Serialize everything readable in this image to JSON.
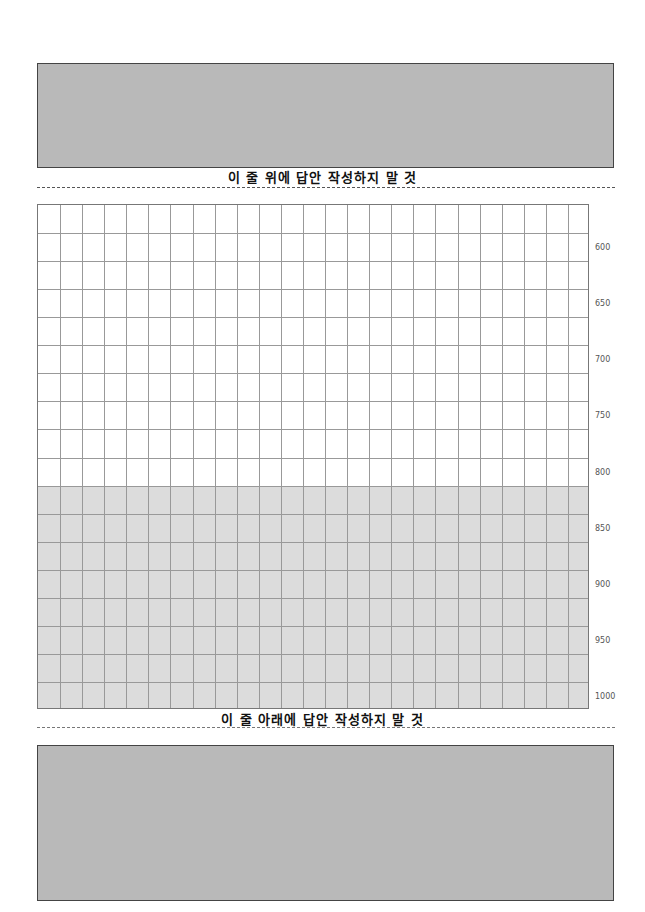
{
  "top_answer_box": {
    "label": ""
  },
  "top_notice": "이 줄 위에 답안 작성하지 말 것",
  "answer_grid": {
    "columns": 25,
    "rows": 18,
    "shaded_from_row": 10,
    "char_count_labels": [
      "600",
      "650",
      "700",
      "750",
      "800",
      "850",
      "900",
      "950",
      "1000"
    ]
  },
  "bottom_notice": "이 줄 아래에 답안 작성하지 말 것",
  "bottom_answer_box": {
    "label": ""
  },
  "colors": {
    "gray_box": "#b9b9b9",
    "shade": "#dcdcdc",
    "grid_line": "#999999"
  }
}
